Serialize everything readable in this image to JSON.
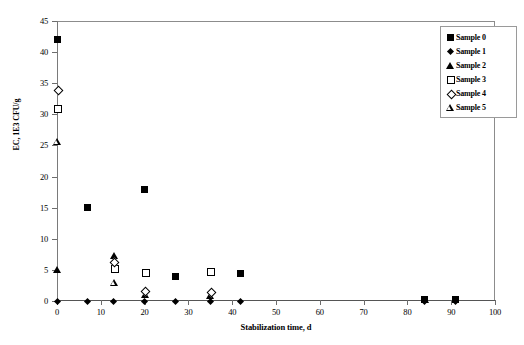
{
  "chart_data": {
    "type": "scatter",
    "title": "",
    "xlabel": "Stabilization time, d",
    "ylabel": "EC, 1E3 CFU/g",
    "xlim": [
      0,
      100
    ],
    "ylim": [
      0,
      45
    ],
    "xticks": [
      0,
      10,
      20,
      30,
      40,
      50,
      60,
      70,
      80,
      90,
      100
    ],
    "yticks": [
      0,
      5,
      10,
      15,
      20,
      25,
      30,
      35,
      40,
      45
    ],
    "xtick_labels": [
      "0",
      "10",
      "20",
      "30",
      "40",
      "50",
      "60",
      "70",
      "80",
      "90",
      "100"
    ],
    "ytick_labels": [
      "0",
      "5",
      "10",
      "15",
      "20",
      "25",
      "30",
      "35",
      "40",
      "45"
    ],
    "grid": false,
    "legend_position": "top-right",
    "series": [
      {
        "name": "Sample 0",
        "marker": "filled-square",
        "color": "#000000",
        "points": [
          {
            "x": 0,
            "y": 42.0
          },
          {
            "x": 7,
            "y": 15.0
          },
          {
            "x": 20,
            "y": 18.0
          },
          {
            "x": 27,
            "y": 4.0
          },
          {
            "x": 42,
            "y": 4.4
          },
          {
            "x": 84,
            "y": 0.2
          },
          {
            "x": 91,
            "y": 0.2
          }
        ]
      },
      {
        "name": "Sample 1",
        "marker": "filled-diamond",
        "color": "#000000",
        "points": [
          {
            "x": 0,
            "y": 0.0
          },
          {
            "x": 7,
            "y": 0.0
          },
          {
            "x": 13,
            "y": 0.0
          },
          {
            "x": 20,
            "y": 0.0
          },
          {
            "x": 27,
            "y": 0.0
          },
          {
            "x": 35,
            "y": 0.0
          },
          {
            "x": 42,
            "y": 0.0
          },
          {
            "x": 84,
            "y": 0.0
          },
          {
            "x": 91,
            "y": 0.0
          }
        ]
      },
      {
        "name": "Sample 2",
        "marker": "filled-triangle",
        "color": "#000000",
        "points": [
          {
            "x": 0,
            "y": 5.0
          },
          {
            "x": 13,
            "y": 7.3
          },
          {
            "x": 20,
            "y": 1.0
          },
          {
            "x": 35,
            "y": 0.9
          },
          {
            "x": 84,
            "y": 0.2
          }
        ]
      },
      {
        "name": "Sample 3",
        "marker": "open-square",
        "color": "#000000",
        "points": [
          {
            "x": 0,
            "y": 31.0
          },
          {
            "x": 13,
            "y": 5.3
          },
          {
            "x": 20,
            "y": 4.7
          },
          {
            "x": 35,
            "y": 4.8
          }
        ]
      },
      {
        "name": "Sample 4",
        "marker": "open-diamond",
        "color": "#000000",
        "points": [
          {
            "x": 0,
            "y": 34.0
          },
          {
            "x": 13,
            "y": 6.3
          },
          {
            "x": 20,
            "y": 1.7
          },
          {
            "x": 35,
            "y": 1.5
          }
        ]
      },
      {
        "name": "Sample 5",
        "marker": "open-triangle",
        "color": "#000000",
        "points": [
          {
            "x": 0,
            "y": 25.6
          },
          {
            "x": 13,
            "y": 3.0
          }
        ]
      }
    ]
  },
  "legend": {
    "items": [
      {
        "label": "Sample 0",
        "marker": "filled-square"
      },
      {
        "label": "Sample 1",
        "marker": "filled-diamond"
      },
      {
        "label": "Sample 2",
        "marker": "filled-triangle"
      },
      {
        "label": "Sample 3",
        "marker": "open-square"
      },
      {
        "label": "Sample 4",
        "marker": "open-diamond"
      },
      {
        "label": "Sample 5",
        "marker": "open-triangle"
      }
    ]
  }
}
